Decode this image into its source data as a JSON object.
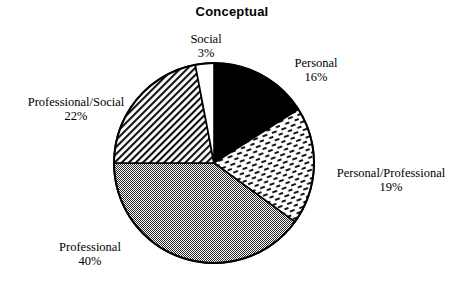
{
  "chart_data": {
    "type": "pie",
    "title": "Conceptual",
    "xlabel": "",
    "ylabel": "",
    "legend_position": "none",
    "grid": false,
    "categories": [
      "Personal",
      "Personal/Professional",
      "Professional",
      "Professional/Social",
      "Social"
    ],
    "values": [
      16,
      19,
      40,
      22,
      3
    ],
    "value_unit": "%",
    "start_angle_deg": 0,
    "direction": "clockwise",
    "slices": [
      {
        "label": "Personal",
        "value": 16,
        "value_label": "16%",
        "fill": "solid-black",
        "color": "#000000"
      },
      {
        "label": "Personal/Professional",
        "value": 19,
        "value_label": "19%",
        "fill": "dash-brick",
        "color": "#ffffff"
      },
      {
        "label": "Professional",
        "value": 40,
        "value_label": "40%",
        "fill": "gray-dither",
        "color": "#808080"
      },
      {
        "label": "Professional/Social",
        "value": 22,
        "value_label": "22%",
        "fill": "diagonal-hatch",
        "color": "#ffffff"
      },
      {
        "label": "Social",
        "value": 3,
        "value_label": "3%",
        "fill": "white",
        "color": "#ffffff"
      }
    ]
  },
  "labels": {
    "social": {
      "name": "Social",
      "pct": "3%"
    },
    "personal": {
      "name": "Personal",
      "pct": "16%"
    },
    "personal_prof": {
      "name": "Personal/Professional",
      "pct": "19%"
    },
    "professional": {
      "name": "Professional",
      "pct": "40%"
    },
    "prof_social": {
      "name": "Professional/Social",
      "pct": "22%"
    }
  },
  "geometry": {
    "center_x": 214,
    "center_y": 163,
    "radius": 100
  }
}
